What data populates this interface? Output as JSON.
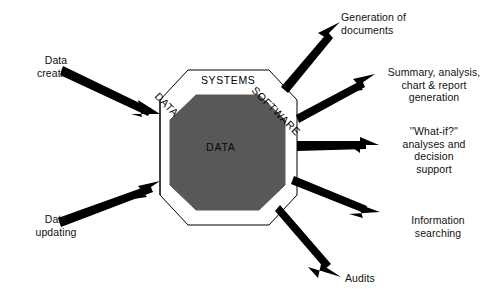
{
  "diagram": {
    "type": "flow-diagram",
    "colors": {
      "background": "#ffffff",
      "core_fill": "#58585a",
      "outline": "#000000",
      "arrow": "#000000",
      "text": "#111111"
    },
    "core": {
      "ring_labels": {
        "top": "SYSTEMS",
        "upper_left": "DATA",
        "upper_right": "SOFTWARE"
      },
      "center_label": "DATA"
    },
    "inputs": [
      {
        "id": "data-creation",
        "label": "Data\ncreation"
      },
      {
        "id": "data-updating",
        "label": "Data\nupdating"
      }
    ],
    "outputs": [
      {
        "id": "generation-documents",
        "label": "Generation of\ndocuments"
      },
      {
        "id": "summary-analysis",
        "label": "Summary, analysis,\nchart & report\ngeneration"
      },
      {
        "id": "what-if",
        "label": "''What-if?''\nanalyses and\ndecision\nsupport"
      },
      {
        "id": "information-searching",
        "label": "Information\nsearching"
      },
      {
        "id": "audits",
        "label": "Audits"
      }
    ]
  }
}
